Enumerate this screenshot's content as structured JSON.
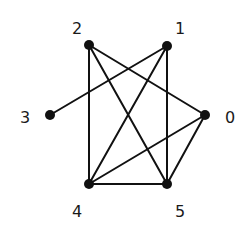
{
  "diagram": {
    "type": "undirected-graph",
    "colors": {
      "background": "#ffffff",
      "edge": "#111111",
      "node": "#111111",
      "label": "#1a1a1a"
    },
    "nodes": [
      {
        "id": "0",
        "label": "0",
        "x": 205,
        "y": 115,
        "label_x": 230,
        "label_y": 123
      },
      {
        "id": "1",
        "label": "1",
        "x": 167,
        "y": 46,
        "label_x": 180,
        "label_y": 34
      },
      {
        "id": "2",
        "label": "2",
        "x": 89,
        "y": 45,
        "label_x": 77,
        "label_y": 34
      },
      {
        "id": "3",
        "label": "3",
        "x": 50,
        "y": 115,
        "label_x": 25,
        "label_y": 123
      },
      {
        "id": "4",
        "label": "4",
        "x": 89,
        "y": 184,
        "label_x": 77,
        "label_y": 217
      },
      {
        "id": "5",
        "label": "5",
        "x": 167,
        "y": 184,
        "label_x": 180,
        "label_y": 217
      }
    ],
    "edges": [
      {
        "from": "2",
        "to": "4"
      },
      {
        "from": "2",
        "to": "5"
      },
      {
        "from": "2",
        "to": "0"
      },
      {
        "from": "1",
        "to": "3"
      },
      {
        "from": "1",
        "to": "4"
      },
      {
        "from": "1",
        "to": "5"
      },
      {
        "from": "0",
        "to": "4"
      },
      {
        "from": "0",
        "to": "5"
      },
      {
        "from": "4",
        "to": "5"
      }
    ]
  }
}
